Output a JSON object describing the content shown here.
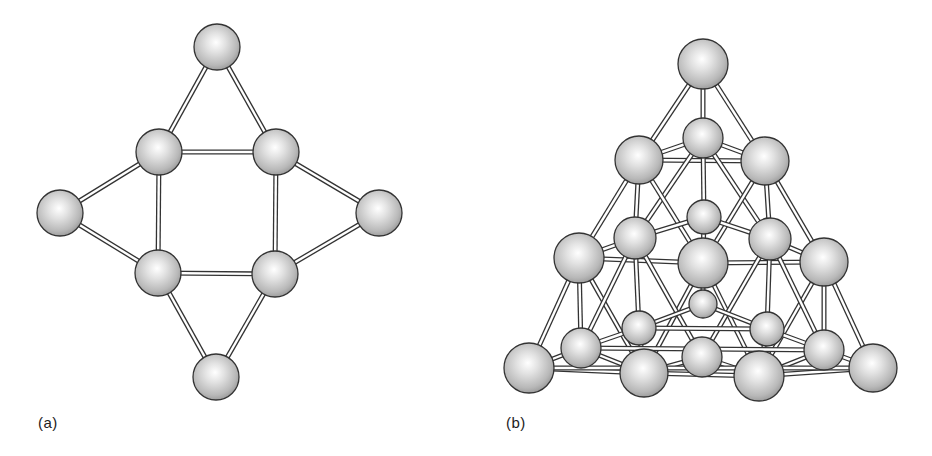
{
  "figure": {
    "panels": [
      {
        "id": "a",
        "label": "(a)",
        "label_pos": [
          38,
          414
        ],
        "atoms": [
          {
            "id": "top",
            "x": 217,
            "y": 47,
            "r": 23
          },
          {
            "id": "ul",
            "x": 159,
            "y": 152,
            "r": 23
          },
          {
            "id": "ur",
            "x": 276,
            "y": 152,
            "r": 23
          },
          {
            "id": "left",
            "x": 60,
            "y": 213,
            "r": 23
          },
          {
            "id": "right",
            "x": 379,
            "y": 213,
            "r": 23
          },
          {
            "id": "ll",
            "x": 158,
            "y": 273,
            "r": 23
          },
          {
            "id": "lr",
            "x": 275,
            "y": 274,
            "r": 23
          },
          {
            "id": "bottom",
            "x": 216,
            "y": 377,
            "r": 23
          }
        ],
        "bonds": [
          [
            "top",
            "ul"
          ],
          [
            "top",
            "ur"
          ],
          [
            "ul",
            "ur"
          ],
          [
            "ul",
            "ll"
          ],
          [
            "ur",
            "lr"
          ],
          [
            "ll",
            "lr"
          ],
          [
            "left",
            "ul"
          ],
          [
            "left",
            "ll"
          ],
          [
            "right",
            "ur"
          ],
          [
            "right",
            "lr"
          ],
          [
            "bottom",
            "ll"
          ],
          [
            "bottom",
            "lr"
          ]
        ]
      },
      {
        "id": "b",
        "label": "(b)",
        "label_pos": [
          506,
          414
        ],
        "atoms": [
          {
            "id": "apex",
            "x": 703,
            "y": 64,
            "r": 25
          },
          {
            "id": "b1",
            "x": 703,
            "y": 138,
            "r": 20
          },
          {
            "id": "l1",
            "x": 639,
            "y": 160,
            "r": 24
          },
          {
            "id": "r1",
            "x": 765,
            "y": 161,
            "r": 24
          },
          {
            "id": "b2",
            "x": 704,
            "y": 217,
            "r": 17
          },
          {
            "id": "ml",
            "x": 635,
            "y": 238,
            "r": 21
          },
          {
            "id": "mr",
            "x": 770,
            "y": 239,
            "r": 21
          },
          {
            "id": "l2",
            "x": 579,
            "y": 258,
            "r": 25
          },
          {
            "id": "c",
            "x": 703,
            "y": 263,
            "r": 25
          },
          {
            "id": "r2",
            "x": 824,
            "y": 262,
            "r": 24
          },
          {
            "id": "b3",
            "x": 703,
            "y": 304,
            "r": 14
          },
          {
            "id": "lml",
            "x": 639,
            "y": 328,
            "r": 17
          },
          {
            "id": "lmr",
            "x": 767,
            "y": 329,
            "r": 17
          },
          {
            "id": "lb",
            "x": 581,
            "y": 348,
            "r": 20
          },
          {
            "id": "rb",
            "x": 824,
            "y": 350,
            "r": 20
          },
          {
            "id": "bc",
            "x": 702,
            "y": 357,
            "r": 20
          },
          {
            "id": "bl",
            "x": 529,
            "y": 368,
            "r": 25
          },
          {
            "id": "bml",
            "x": 644,
            "y": 373,
            "r": 24
          },
          {
            "id": "bmr",
            "x": 759,
            "y": 376,
            "r": 25
          },
          {
            "id": "br",
            "x": 873,
            "y": 368,
            "r": 24
          }
        ],
        "bonds": [
          [
            "apex",
            "l1"
          ],
          [
            "apex",
            "r1"
          ],
          [
            "apex",
            "b1"
          ],
          [
            "b1",
            "l1"
          ],
          [
            "b1",
            "r1"
          ],
          [
            "l1",
            "r1"
          ],
          [
            "b1",
            "b2"
          ],
          [
            "b1",
            "ml"
          ],
          [
            "b1",
            "mr"
          ],
          [
            "l1",
            "l2"
          ],
          [
            "l1",
            "ml"
          ],
          [
            "l1",
            "c"
          ],
          [
            "r1",
            "r2"
          ],
          [
            "r1",
            "mr"
          ],
          [
            "r1",
            "c"
          ],
          [
            "b2",
            "ml"
          ],
          [
            "b2",
            "mr"
          ],
          [
            "b2",
            "c"
          ],
          [
            "l2",
            "ml"
          ],
          [
            "l2",
            "c"
          ],
          [
            "c",
            "r2"
          ],
          [
            "mr",
            "r2"
          ],
          [
            "ml",
            "lml"
          ],
          [
            "mr",
            "lmr"
          ],
          [
            "l2",
            "bl"
          ],
          [
            "l2",
            "lb"
          ],
          [
            "l2",
            "bml"
          ],
          [
            "r2",
            "br"
          ],
          [
            "r2",
            "rb"
          ],
          [
            "r2",
            "bmr"
          ],
          [
            "c",
            "bml"
          ],
          [
            "c",
            "bmr"
          ],
          [
            "c",
            "b3"
          ],
          [
            "ml",
            "lb"
          ],
          [
            "mr",
            "rb"
          ],
          [
            "ml",
            "bc"
          ],
          [
            "mr",
            "bc"
          ],
          [
            "b3",
            "lml"
          ],
          [
            "b3",
            "lmr"
          ],
          [
            "lml",
            "lmr"
          ],
          [
            "lml",
            "lb"
          ],
          [
            "lmr",
            "rb"
          ],
          [
            "lml",
            "bml"
          ],
          [
            "lmr",
            "bmr"
          ],
          [
            "lb",
            "bl"
          ],
          [
            "lb",
            "bml"
          ],
          [
            "rb",
            "br"
          ],
          [
            "rb",
            "bmr"
          ],
          [
            "lb",
            "rb"
          ],
          [
            "bc",
            "bml"
          ],
          [
            "bc",
            "bmr"
          ],
          [
            "bl",
            "bml"
          ],
          [
            "bml",
            "bmr"
          ],
          [
            "bmr",
            "br"
          ],
          [
            "bl",
            "br"
          ]
        ]
      }
    ]
  },
  "colors": {
    "sphere_highlight": "#ffffff",
    "sphere_mid": "#d0d0d0",
    "sphere_shadow": "#9a9a9a",
    "outline": "#333333",
    "rod_fill": "#ffffff"
  }
}
